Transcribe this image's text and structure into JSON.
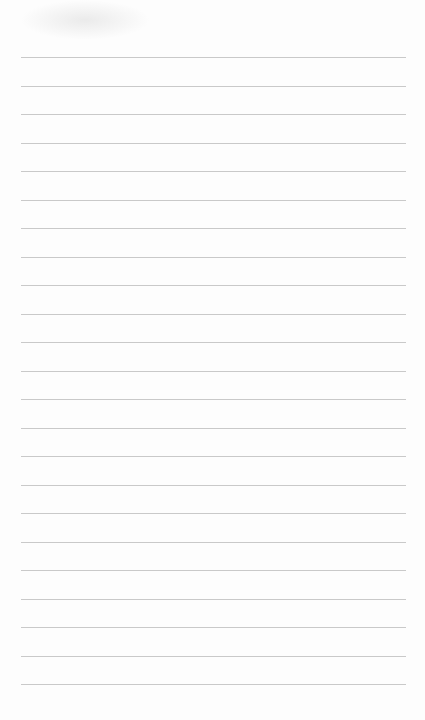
{
  "page": {
    "type": "blank lined paper",
    "line_count": 23,
    "first_line_y": 57,
    "line_spacing": 28.5,
    "line_left": 21,
    "line_width": 385,
    "line_color": "#c9c9c9",
    "paper_color": "#fdfdfd"
  }
}
